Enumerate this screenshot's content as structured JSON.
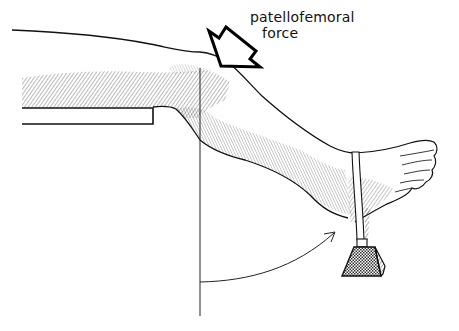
{
  "figure": {
    "annotation": {
      "line1": "patellofemoral",
      "line2": "force"
    },
    "elements": [
      "leg-outline",
      "table-edge",
      "force-arrow",
      "vertical-reference-line",
      "motion-arc-arrow",
      "ankle-strap",
      "weight"
    ],
    "colors": {
      "ink": "#111111",
      "background": "#ffffff",
      "hatch": "#333333"
    }
  }
}
